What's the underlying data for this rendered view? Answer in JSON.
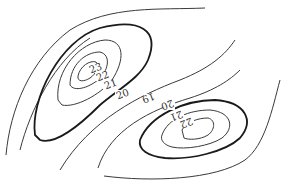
{
  "figure": {
    "type": "contour-map",
    "background": "#ffffff",
    "line_color": "#333333"
  },
  "contour_labels": {
    "upper_left_center": {
      "l23": "23",
      "l22": "22",
      "l21": "21",
      "l20": "20"
    },
    "lower_right_center": {
      "l22": "22",
      "l21": "21",
      "l20": "20"
    },
    "saddle": {
      "l19": "19"
    }
  }
}
